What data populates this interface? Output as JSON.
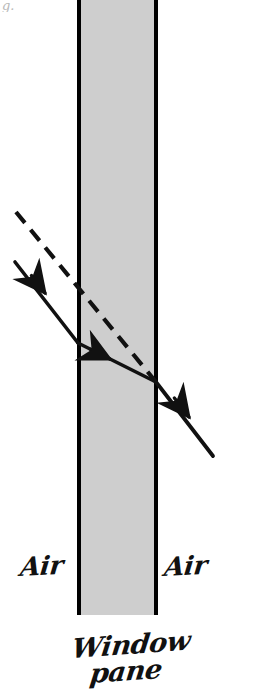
{
  "figure": {
    "background_color": "#ffffff",
    "ink_color": "#111111",
    "glass_fill_color": "#cecece",
    "glass_edge_color": "#000000",
    "cropped_caption_fragment": "g.",
    "labels": {
      "air_left": "Air",
      "air_right": "Air",
      "medium_line1": "Window",
      "medium_line2": "pane"
    },
    "geometry": {
      "canvas_width": 254,
      "canvas_height": 696,
      "pane_left_x": 77,
      "pane_right_x": 158,
      "pane_top_y": 0,
      "pane_bottom_y": 615,
      "pane_edge_width": 4,
      "incident_ray": {
        "x1": 15,
        "y1": 262,
        "x2": 78,
        "y2": 343
      },
      "incident_arrow": {
        "x": 45,
        "y": 293
      },
      "refracted_ray": {
        "x1": 78,
        "y1": 343,
        "x2": 156,
        "y2": 382
      },
      "refracted_arrow": {
        "x": 110,
        "y": 359
      },
      "emergent_ray": {
        "x1": 156,
        "y1": 382,
        "x2": 213,
        "y2": 456
      },
      "emergent_arrow": {
        "x": 189,
        "y": 417
      },
      "dashed_extension": {
        "x1": 16,
        "y1": 212,
        "x2": 156,
        "y2": 382
      },
      "dash_pattern": "14 9"
    }
  }
}
